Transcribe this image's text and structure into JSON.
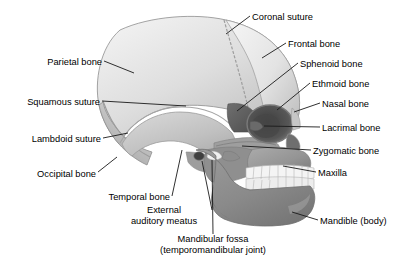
{
  "figure": {
    "background_color": "#ffffff",
    "text_color": "#000000",
    "leader_line_color": "#1a1a1a",
    "width": 407,
    "height": 270
  },
  "palette": {
    "cranium_light": "#eeeeee",
    "cranium_mid": "#d8d8d8",
    "parietal_shade": "#c9c9c9",
    "temporal_bone": "#c2c2c2",
    "occipital_shade": "#b5b5b5",
    "frontal_light": "#e8e8e8",
    "face_mid": "#9a9a9a",
    "mandible_dark": "#8a8a8a",
    "orbit_dark": "#4a4a4a",
    "sphenoid_dark": "#5a5a5a",
    "teeth_white": "#f4f4f4",
    "outline": "#6d6d6d"
  },
  "labels": {
    "coronal_suture": {
      "text": "Coronal suture",
      "side": "right",
      "x": 252,
      "y": 12,
      "target_x": 226,
      "target_y": 34
    },
    "frontal_bone": {
      "text": "Frontal bone",
      "side": "right",
      "x": 288,
      "y": 39,
      "target_x": 262,
      "target_y": 58
    },
    "sphenoid_bone": {
      "text": "Sphenoid bone",
      "side": "right",
      "x": 300,
      "y": 59,
      "target_x": 237,
      "target_y": 111
    },
    "ethmoid_bone": {
      "text": "Ethmoid bone",
      "side": "right",
      "x": 312,
      "y": 79,
      "target_x": 277,
      "target_y": 110
    },
    "nasal_bone": {
      "text": "Nasal bone",
      "side": "right",
      "x": 322,
      "y": 99,
      "target_x": 294,
      "target_y": 112
    },
    "lacrimal_bone": {
      "text": "Lacrimal bone",
      "side": "right",
      "x": 322,
      "y": 123,
      "target_x": 264,
      "target_y": 125
    },
    "zygomatic_bone": {
      "text": "Zygomatic bone",
      "side": "right",
      "x": 313,
      "y": 146,
      "target_x": 242,
      "target_y": 146
    },
    "maxilla": {
      "text": "Maxilla",
      "side": "right",
      "x": 318,
      "y": 168,
      "target_x": 283,
      "target_y": 166
    },
    "mandible_body": {
      "text": "Mandible (body)",
      "side": "right",
      "x": 320,
      "y": 216,
      "target_x": 292,
      "target_y": 212
    },
    "parietal_bone": {
      "text": "Parietal bone",
      "side": "left",
      "x": 37,
      "y": 57,
      "target_x": 122,
      "target_y": 72
    },
    "squamous_suture": {
      "text": "Squamous suture",
      "side": "left",
      "x": 12,
      "y": 97,
      "target_x": 171,
      "target_y": 104
    },
    "lambdoid_suture": {
      "text": "Lambdoid suture",
      "side": "left",
      "x": 14,
      "y": 134,
      "target_x": 118,
      "target_y": 133
    },
    "occipital_bone": {
      "text": "Occipital bone",
      "side": "left",
      "x": 32,
      "y": 169,
      "target_x": 114,
      "target_y": 155
    },
    "temporal_bone": {
      "text": "Temporal bone",
      "side": "left",
      "x": 98,
      "y": 192,
      "target_x": 164,
      "target_y": 139
    },
    "external_auditory_meatus": {
      "line1": "External",
      "line2": "auditory meatus",
      "side": "left",
      "x": 140,
      "y": 209,
      "target_x": 206,
      "target_y": 157
    },
    "mandibular_fossa": {
      "line1": "Mandibular fossa",
      "line2": "(temporomandibular joint)",
      "side": "center",
      "x": 163,
      "y": 238,
      "target_x": 211,
      "target_y": 150
    }
  }
}
